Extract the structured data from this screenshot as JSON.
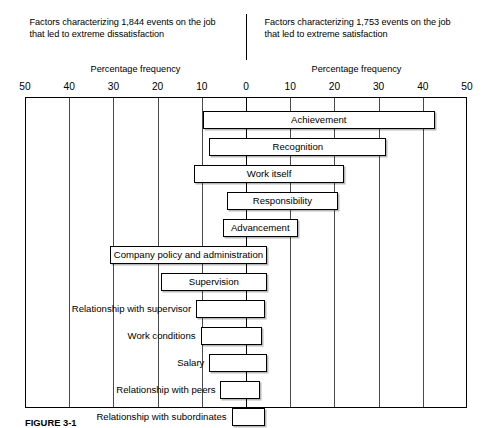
{
  "header": {
    "left_caption": "Factors characterizing 1,844 events on the job that led to extreme dissatisfaction",
    "right_caption": "Factors characterizing 1,753 events on the job that led to extreme satisfaction",
    "left_axis_title": "Percentage frequency",
    "right_axis_title": "Percentage frequency"
  },
  "caption": "FIGURE 3-1",
  "chart_data": {
    "type": "bar",
    "orientation": "horizontal",
    "style": "diverging-tornado",
    "title": "",
    "subtitle": "",
    "xlabel": "Percentage frequency",
    "ylabel": "",
    "xlim": [
      -50,
      50
    ],
    "grid": true,
    "legend_position": "none",
    "axis_note": "Left side = dissatisfaction (negative direction), right side = satisfaction (positive direction); both axes labeled with absolute percentages.",
    "tick_labels": [
      "50",
      "40",
      "30",
      "20",
      "10",
      "0",
      "10",
      "20",
      "30",
      "40",
      "50"
    ],
    "tick_values": [
      -50,
      -40,
      -30,
      -20,
      -10,
      0,
      10,
      20,
      30,
      40,
      50
    ],
    "categories": [
      "Achievement",
      "Recognition",
      "Work itself",
      "Responsibility",
      "Advancement",
      "Company policy and administration",
      "Supervision",
      "Relationship with supervisor",
      "Work conditions",
      "Salary",
      "Relationship with peers",
      "Relationship with subordinates"
    ],
    "bars": [
      {
        "label": "Achievement",
        "start": -10.0,
        "end": 42.5,
        "label_placement": "inside"
      },
      {
        "label": "Recognition",
        "start": -8.5,
        "end": 31.5,
        "label_placement": "inside"
      },
      {
        "label": "Work itself",
        "start": -12.0,
        "end": 22.0,
        "label_placement": "inside"
      },
      {
        "label": "Responsibility",
        "start": -4.5,
        "end": 20.5,
        "label_placement": "inside"
      },
      {
        "label": "Advancement",
        "start": -5.5,
        "end": 11.5,
        "label_placement": "inside"
      },
      {
        "label": "Company policy and administration",
        "start": -31.0,
        "end": 4.5,
        "label_placement": "inside"
      },
      {
        "label": "Supervision",
        "start": -19.5,
        "end": 4.5,
        "label_placement": "inside"
      },
      {
        "label": "Relationship with supervisor",
        "start": -11.5,
        "end": 4.0,
        "label_placement": "outside"
      },
      {
        "label": "Work conditions",
        "start": -10.5,
        "end": 3.5,
        "label_placement": "outside"
      },
      {
        "label": "Salary",
        "start": -8.5,
        "end": 4.5,
        "label_placement": "outside"
      },
      {
        "label": "Relationship with peers",
        "start": -6.0,
        "end": 3.0,
        "label_placement": "outside"
      },
      {
        "label": "Relationship with subordinates",
        "start": -3.5,
        "end": 4.0,
        "label_placement": "outside"
      }
    ]
  }
}
